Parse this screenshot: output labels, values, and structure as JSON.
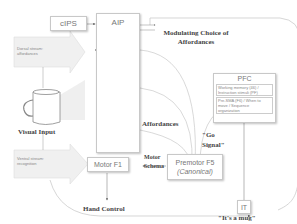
{
  "diagram": {
    "nodes": {
      "cips": {
        "label": "cIPS"
      },
      "aip": {
        "label": "AIP"
      },
      "pfc": {
        "label": "PFC",
        "sub1": "Working memory (46) / Instruction stimuli (PF)",
        "sub2": "Pre-SMA (F6) / When to move / Sequence organization"
      },
      "motor_f1": {
        "label": "Motor F1"
      },
      "premotor_f5": {
        "label": "Premotor F5",
        "sublabel": "(Canonical)"
      },
      "it": {
        "label": "IT"
      }
    },
    "annotations": {
      "dorsal_stream": "Dorsal stream: affordances",
      "ventral_stream": "Ventral stream: recognition",
      "visual_input": "Visual Input",
      "modulating": "Modulating Choice of Affordances",
      "affordances": "Affordances",
      "go_signal": "\"Go Signal\"",
      "motor_schema": "Motor Schema",
      "hand_control": "Hand Control",
      "its_a_mug": "\"It's a mug\""
    },
    "colors": {
      "line": "#b0b0b0",
      "box_border": "#c8c8c8",
      "arrow_fill": "#ececec"
    }
  }
}
